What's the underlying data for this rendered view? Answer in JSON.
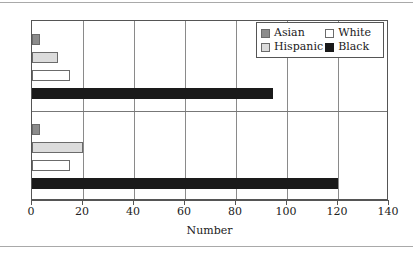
{
  "chart_data": {
    "type": "bar",
    "orientation": "horizontal",
    "title": "",
    "xlabel": "Number",
    "ylabel": "",
    "xlim": [
      0,
      140
    ],
    "xticks": [
      0,
      20,
      40,
      60,
      80,
      100,
      120,
      140
    ],
    "grid": true,
    "grid_axis": "x",
    "legend_position": "upper right",
    "categories": [
      "Suspects",
      "Victims"
    ],
    "series": [
      {
        "name": "Asian",
        "color": "#8c8c8c",
        "values": [
          3,
          3
        ]
      },
      {
        "name": "Hispanic",
        "color": "#dcdcdc",
        "values": [
          10,
          20
        ]
      },
      {
        "name": "White",
        "color": "#ffffff",
        "values": [
          15,
          15
        ]
      },
      {
        "name": "Black",
        "color": "#1a1a1a",
        "values": [
          94.5,
          120
        ]
      }
    ]
  },
  "axis": {
    "x_title": "Number",
    "tick_labels": [
      "0",
      "20",
      "40",
      "60",
      "80",
      "100",
      "120",
      "140"
    ]
  },
  "legend": {
    "entries": [
      {
        "label": "Asian"
      },
      {
        "label": "White"
      },
      {
        "label": "Hispanic"
      },
      {
        "label": "Black"
      }
    ]
  },
  "y_categories": [
    {
      "label": "Suspects"
    },
    {
      "label": "Victims"
    }
  ]
}
